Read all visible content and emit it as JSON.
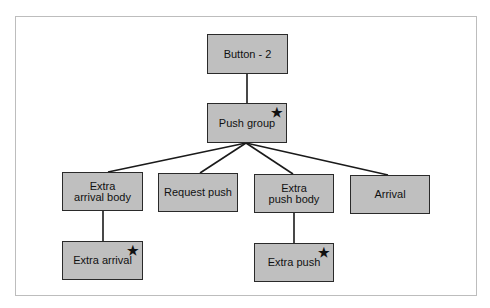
{
  "diagram": {
    "type": "tree",
    "marker_symbol": "★",
    "colors": {
      "node_fill": "#bfbfbf",
      "node_border": "#2a2a2a",
      "edge": "#1a1a1a",
      "frame": "#bdbdbd"
    },
    "nodes": [
      {
        "id": "button-2",
        "label": "Button - 2",
        "starred": false
      },
      {
        "id": "push-group",
        "label": "Push group",
        "starred": true
      },
      {
        "id": "extra-arrival-body",
        "label": "Extra\narrival body",
        "starred": false
      },
      {
        "id": "request-push",
        "label": "Request push",
        "starred": false
      },
      {
        "id": "extra-push-body",
        "label": "Extra\npush body",
        "starred": false
      },
      {
        "id": "arrival",
        "label": "Arrival",
        "starred": false
      },
      {
        "id": "extra-arrival",
        "label": "Extra arrival",
        "starred": true
      },
      {
        "id": "extra-push",
        "label": "Extra push",
        "starred": true
      }
    ],
    "edges": [
      [
        "button-2",
        "push-group"
      ],
      [
        "push-group",
        "extra-arrival-body"
      ],
      [
        "push-group",
        "request-push"
      ],
      [
        "push-group",
        "extra-push-body"
      ],
      [
        "push-group",
        "arrival"
      ],
      [
        "extra-arrival-body",
        "extra-arrival"
      ],
      [
        "extra-push-body",
        "extra-push"
      ]
    ]
  }
}
